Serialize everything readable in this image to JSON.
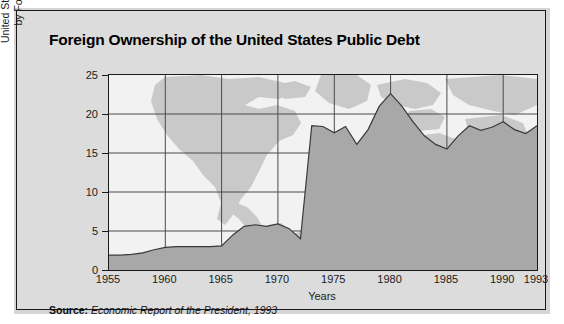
{
  "figure": {
    "title": "Foreign Ownership of the United States Public Debt",
    "source_label": "Source:",
    "source_text": "Economic Report of the President, 1993"
  },
  "chart_data": {
    "type": "area",
    "title": "Foreign Ownership of the United States Public Debt",
    "xlabel": "Years",
    "ylabel": "United States Public Debt  Held by Foreigners (percent)",
    "ylabel_line1": "United States Public Debt  Held",
    "ylabel_line2": "by Foreigners (percent)",
    "xlim": [
      1955,
      1993
    ],
    "ylim": [
      0,
      25
    ],
    "yticks": [
      0,
      5,
      10,
      15,
      20,
      25
    ],
    "ytick_labels": [
      "0",
      "5",
      "10",
      "15",
      "20",
      "25"
    ],
    "xticks": [
      1955,
      1960,
      1965,
      1970,
      1975,
      1980,
      1985,
      1990,
      1993
    ],
    "xtick_labels": [
      "1955",
      "1960",
      "1965",
      "1970",
      "1975",
      "1980",
      "1985",
      "1990",
      "1993"
    ],
    "grid": true,
    "legend": "none",
    "series_name": "United States Public Debt Held by Foreigners (percent)",
    "x": [
      1955,
      1956,
      1957,
      1958,
      1959,
      1960,
      1961,
      1962,
      1963,
      1964,
      1965,
      1966,
      1967,
      1968,
      1969,
      1970,
      1971,
      1972,
      1973,
      1974,
      1975,
      1976,
      1977,
      1978,
      1979,
      1980,
      1981,
      1982,
      1983,
      1984,
      1985,
      1986,
      1987,
      1988,
      1989,
      1990,
      1991,
      1992,
      1993
    ],
    "values": [
      1.9,
      1.9,
      2.0,
      2.2,
      2.6,
      2.9,
      3.0,
      3.0,
      3.0,
      3.0,
      3.1,
      4.5,
      5.6,
      5.8,
      5.6,
      5.9,
      5.3,
      4.0,
      18.5,
      18.4,
      17.6,
      18.4,
      16.1,
      18.0,
      21.0,
      22.6,
      21.0,
      19.0,
      17.2,
      16.1,
      15.5,
      17.2,
      18.5,
      17.9,
      18.3,
      19.0,
      18.0,
      17.5,
      18.5
    ],
    "colors": {
      "area_fill": "#a8a8a8",
      "area_line": "#3a3a3a",
      "plot_background": "#f2f2f2",
      "map_silhouette": "#c9c9c9",
      "grid": "#4a4a4a",
      "panel_background": "#dcdcdc",
      "border": "#1a1a1a",
      "text": "#111111"
    }
  }
}
